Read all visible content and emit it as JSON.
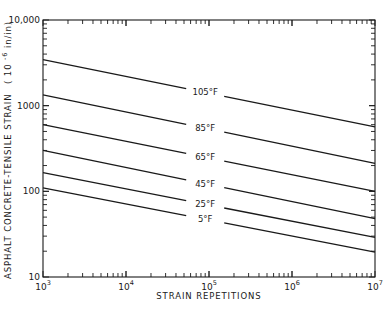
{
  "chart_data": {
    "type": "line",
    "title": "",
    "xlabel": "STRAIN REPETITIONS",
    "ylabel": "ASPHALT CONCRETE-TENSILE STRAIN (10^-6 in/in)",
    "xscale": "log",
    "yscale": "log",
    "xlim": [
      1000,
      10000000
    ],
    "ylim": [
      10,
      10000
    ],
    "grid": false,
    "legend": "inline labels on lines",
    "x_ticks": [
      {
        "value": 1000,
        "base": "10",
        "exp": "3"
      },
      {
        "value": 10000,
        "base": "10",
        "exp": "4"
      },
      {
        "value": 100000,
        "base": "10",
        "exp": "5"
      },
      {
        "value": 1000000,
        "base": "10",
        "exp": "6"
      },
      {
        "value": 10000000,
        "base": "10",
        "exp": "7"
      }
    ],
    "y_ticks": [
      {
        "value": 10,
        "label": "10"
      },
      {
        "value": 100,
        "label": "100"
      },
      {
        "value": 1000,
        "label": "1000"
      },
      {
        "value": 10000,
        "label": "10,000"
      }
    ],
    "x": [
      1000,
      10000000
    ],
    "series": [
      {
        "name": "105°F",
        "values": [
          3450,
          565
        ],
        "label_at_x": 90000
      },
      {
        "name": "85°F",
        "values": [
          1340,
          212
        ],
        "label_at_x": 90000
      },
      {
        "name": "65°F",
        "values": [
          600,
          100
        ],
        "label_at_x": 90000
      },
      {
        "name": "45°F",
        "values": [
          300,
          48
        ],
        "label_at_x": 90000
      },
      {
        "name": "25°F",
        "values": [
          165,
          29
        ],
        "label_at_x": 90000
      },
      {
        "name": "5°F",
        "values": [
          110,
          19.5
        ],
        "label_at_x": 90000
      }
    ]
  },
  "labels": {
    "x_title": "STRAIN REPETITIONS",
    "y_title_main": "ASPHALT CONCRETE-TENSILE STRAIN",
    "y_title_units_open": "( 10",
    "y_title_units_exp": "-6",
    "y_title_units_close": " in/in)"
  },
  "colors": {
    "line": "#1a1a1a",
    "axis": "#1a1a1a",
    "background": "#ffffff"
  }
}
